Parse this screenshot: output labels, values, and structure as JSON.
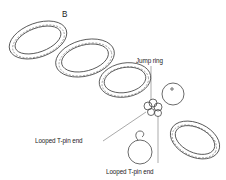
{
  "figure": {
    "panel_label": "B",
    "labels": {
      "jump_ring": "Jump ring",
      "looped_tpin_end_left": "Looped T-pin end",
      "looped_tpin_end_bottom": "Looped T-pin end"
    },
    "elements": [
      {
        "type": "textured-ring",
        "count": 4
      },
      {
        "type": "jump-ring",
        "count": 3
      },
      {
        "type": "bead-with-looped-pin",
        "count": 2
      }
    ],
    "colors": {
      "line": "#444444",
      "background": "#ffffff"
    }
  }
}
